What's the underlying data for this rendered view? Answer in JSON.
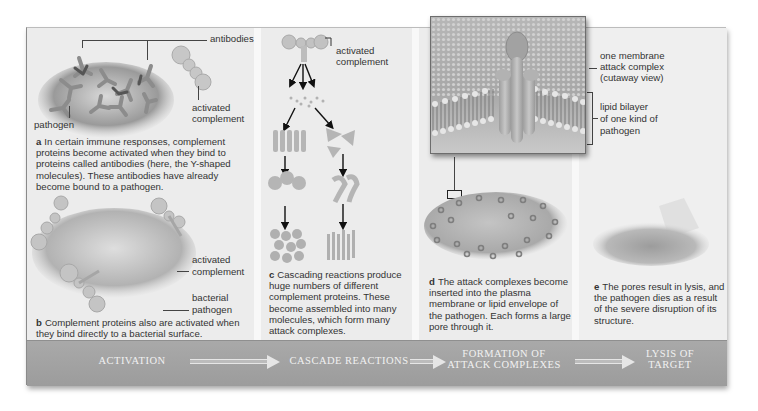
{
  "figure": {
    "panels": {
      "a": {
        "letter": "a",
        "caption": "In certain immune responses, complement proteins become activated when they bind to proteins called antibodies (here, the Y-shaped molecules). These antibodies have already become bound to a pathogen.",
        "labels": {
          "antibodies": "antibodies",
          "activated": "activated",
          "complement": "complement",
          "pathogen": "pathogen"
        }
      },
      "b": {
        "letter": "b",
        "caption": "Complement proteins also are activated when they bind directly to a bacterial surface.",
        "labels": {
          "activated": "activated",
          "complement": "complement",
          "bacterial": "bacterial",
          "pathogen": "pathogen"
        }
      },
      "c": {
        "letter": "c",
        "caption": "Cascading reactions produce huge numbers of different complement proteins. These become assembled into many molecules, which form many attack complexes.",
        "labels": {
          "activated": "activated",
          "complement": "complement"
        }
      },
      "d": {
        "letter": "d",
        "caption": "The attack complexes become inserted into the plasma membrane or lipid envelope of the pathogen. Each forms a large pore through it.",
        "labels": {
          "mac_1": "one membrane",
          "mac_2": "attack complex",
          "mac_3": "(cutaway view)",
          "lipid_1": "lipid bilayer",
          "lipid_2": "of one kind of",
          "lipid_3": "pathogen"
        }
      },
      "e": {
        "letter": "e",
        "caption": "The pores result in lysis, and the pathogen dies as a result of the severe disruption of its structure."
      }
    },
    "banner": {
      "steps": [
        {
          "line1": "ACTIVATION"
        },
        {
          "line1": "CASCADE REACTIONS"
        },
        {
          "line1": "FORMATION OF",
          "line2": "ATTACK COMPLEXES"
        },
        {
          "line1": "LYSIS OF",
          "line2": "TARGET"
        }
      ]
    },
    "colors": {
      "panel_bg": "#ececec",
      "banner_bg": "#a3a3a3",
      "banner_text": "#f1f1f1",
      "text": "#333333"
    }
  }
}
